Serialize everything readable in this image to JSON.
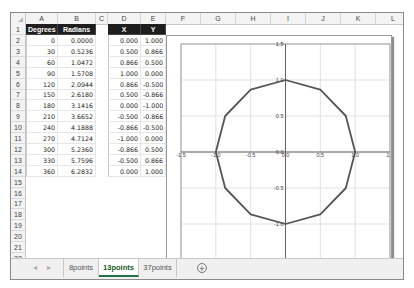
{
  "columns": [
    "A",
    "B",
    "C",
    "D",
    "E",
    "F",
    "G",
    "H",
    "I",
    "J",
    "K",
    "L"
  ],
  "column_widths": [
    32,
    38,
    12,
    33,
    25,
    35,
    35,
    35,
    35,
    35,
    35,
    35
  ],
  "rows": [
    "1",
    "2",
    "3",
    "4",
    "5",
    "6",
    "7",
    "8",
    "9",
    "10",
    "11",
    "12",
    "13",
    "14",
    "15",
    "16",
    "17",
    "18",
    "19",
    "20",
    "21",
    "22",
    "23"
  ],
  "table1": {
    "headers": [
      "Degrees",
      "Radians"
    ],
    "rows": [
      [
        "0",
        "0.0000"
      ],
      [
        "30",
        "0.5236"
      ],
      [
        "60",
        "1.0472"
      ],
      [
        "90",
        "1.5708"
      ],
      [
        "120",
        "2.0944"
      ],
      [
        "150",
        "2.6180"
      ],
      [
        "180",
        "3.1416"
      ],
      [
        "210",
        "3.6652"
      ],
      [
        "240",
        "4.1888"
      ],
      [
        "270",
        "4.7124"
      ],
      [
        "300",
        "5.2360"
      ],
      [
        "330",
        "5.7596"
      ],
      [
        "360",
        "6.2832"
      ]
    ]
  },
  "table2": {
    "headers": [
      "X",
      "Y"
    ],
    "rows": [
      [
        "0.000",
        "1.000"
      ],
      [
        "0.500",
        "0.866"
      ],
      [
        "0.866",
        "0.500"
      ],
      [
        "1.000",
        "0.000"
      ],
      [
        "0.866",
        "-0.500"
      ],
      [
        "0.500",
        "-0.866"
      ],
      [
        "0.000",
        "-1.000"
      ],
      [
        "-0.500",
        "-0.866"
      ],
      [
        "-0.866",
        "-0.500"
      ],
      [
        "-1.000",
        "0.000"
      ],
      [
        "-0.866",
        "0.500"
      ],
      [
        "-0.500",
        "0.866"
      ],
      [
        "0.000",
        "1.000"
      ]
    ]
  },
  "tabs": {
    "prev": "◂",
    "next": "▸",
    "items": [
      {
        "label": "8points",
        "active": false
      },
      {
        "label": "13points",
        "active": true
      },
      {
        "label": "37points",
        "active": false
      }
    ],
    "add": "+"
  },
  "chart_data": {
    "type": "scatter",
    "title": "",
    "xlabel": "",
    "ylabel": "",
    "xlim": [
      -1.5,
      1.5
    ],
    "ylim": [
      -1.5,
      1.5
    ],
    "grid": true,
    "legend": "none",
    "x_ticks": [
      "-1.5",
      "-1.0",
      "-0.5",
      "0.0",
      "0.5",
      "1.0",
      "1.5"
    ],
    "y_ticks": [
      "1.5",
      "1.0",
      "0.5",
      "0.0",
      "-0.5",
      "-1.0",
      "-1.5"
    ],
    "series": [
      {
        "name": "Y",
        "style": "line",
        "color": "#555555",
        "x": [
          0.0,
          0.5,
          0.866,
          1.0,
          0.866,
          0.5,
          0.0,
          -0.5,
          -0.866,
          -1.0,
          -0.866,
          -0.5,
          0.0
        ],
        "y": [
          1.0,
          0.866,
          0.5,
          0.0,
          -0.5,
          -0.866,
          -1.0,
          -0.866,
          -0.5,
          0.0,
          0.5,
          0.866,
          1.0
        ]
      }
    ]
  }
}
